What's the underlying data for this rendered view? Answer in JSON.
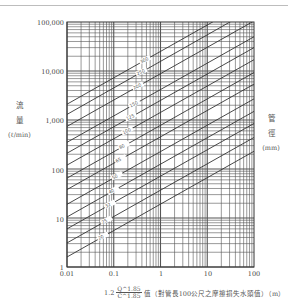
{
  "chart_data": {
    "type": "line",
    "title": "",
    "xlabel": "1.2 Q^1.85 / C^1.85 值（對管長100公尺之摩擦損失水頭值）（m）",
    "ylabel": "流量 (ℓ/min)",
    "y2label": "管徑 (mm)",
    "xscale": "log",
    "yscale": "log",
    "xlim": [
      0.01,
      100
    ],
    "ylim": [
      1,
      100000
    ],
    "grid": true,
    "x_ticks": [
      "0.01",
      "0.1",
      "1",
      "10",
      "100"
    ],
    "y_ticks": [
      "1",
      "10",
      "100",
      "1,000",
      "10,000",
      "100,000"
    ],
    "slope_loglog": 0.54,
    "series": [
      {
        "name": "300",
        "x": [
          0.01,
          100
        ],
        "y": [
          2100,
          300000
        ]
      },
      {
        "name": "250",
        "x": [
          0.01,
          100
        ],
        "y": [
          1300,
          190000
        ]
      },
      {
        "name": "200",
        "x": [
          0.01,
          100
        ],
        "y": [
          740,
          105000
        ]
      },
      {
        "name": "150",
        "x": [
          0.01,
          100
        ],
        "y": [
          350,
          50000
        ]
      },
      {
        "name": "125",
        "x": [
          0.01,
          100
        ],
        "y": [
          210,
          30000
        ]
      },
      {
        "name": "100",
        "x": [
          0.01,
          100
        ],
        "y": [
          120,
          17000
        ]
      },
      {
        "name": "80",
        "x": [
          0.01,
          100
        ],
        "y": [
          65,
          9300
        ]
      },
      {
        "name": "65",
        "x": [
          0.01,
          100
        ],
        "y": [
          38,
          5400
        ]
      },
      {
        "name": "50",
        "x": [
          0.01,
          100
        ],
        "y": [
          19,
          2700
        ]
      },
      {
        "name": "40",
        "x": [
          0.01,
          100
        ],
        "y": [
          10.5,
          1500
        ]
      },
      {
        "name": "32",
        "x": [
          0.01,
          100
        ],
        "y": [
          6,
          850
        ]
      },
      {
        "name": "25",
        "x": [
          0.01,
          100
        ],
        "y": [
          3.1,
          440
        ]
      },
      {
        "name": "20",
        "x": [
          0.01,
          100
        ],
        "y": [
          1.6,
          230
        ]
      }
    ]
  },
  "axes": {
    "y_ticks": [
      {
        "label": "100,000",
        "top": 19
      },
      {
        "label": "10,000",
        "top": 68
      },
      {
        "label": "1,000",
        "top": 117
      },
      {
        "label": "100",
        "top": 167
      },
      {
        "label": "10",
        "top": 216
      },
      {
        "label": "1",
        "top": 264
      }
    ],
    "x_ticks": [
      {
        "label": "0.01",
        "left": 52
      },
      {
        "label": "0.1",
        "left": 99
      },
      {
        "label": "1",
        "left": 146
      },
      {
        "label": "10",
        "left": 193
      },
      {
        "label": "100",
        "left": 239
      }
    ]
  },
  "left_label": {
    "char1": "流",
    "char2": "量",
    "unit": "(ℓ/min)"
  },
  "right_label": {
    "char1": "管",
    "char2": "徑",
    "unit": "(mm)"
  },
  "caption": {
    "prefix": "1.2",
    "num": "Q^1.85",
    "den": "C^1.85",
    "text": "值（對管長100公尺之摩擦損失水頭值）（m）"
  }
}
